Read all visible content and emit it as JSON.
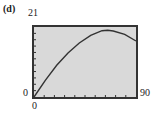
{
  "panel_label": "(d)",
  "axes": {
    "ymax_label": "21",
    "ymin_label": "0",
    "xmin_label": "0",
    "xmax_label": "90"
  },
  "colors": {
    "plot_background": "#d9d9d9",
    "frame": "#333333",
    "curve": "#333333"
  },
  "chart_data": {
    "type": "line",
    "title": "(d)",
    "xlabel": "",
    "ylabel": "",
    "xlim": [
      0,
      90
    ],
    "ylim": [
      0,
      21
    ],
    "grid": false,
    "x_ticks_count": 9,
    "y_ticks_count": 10,
    "series": [
      {
        "name": "curve",
        "x": [
          0,
          10,
          20,
          30,
          40,
          50,
          60,
          65,
          70,
          80,
          90
        ],
        "y": [
          0,
          5.0,
          9.5,
          13.2,
          16.2,
          18.5,
          19.9,
          20.0,
          19.8,
          18.8,
          16.8
        ]
      }
    ]
  }
}
